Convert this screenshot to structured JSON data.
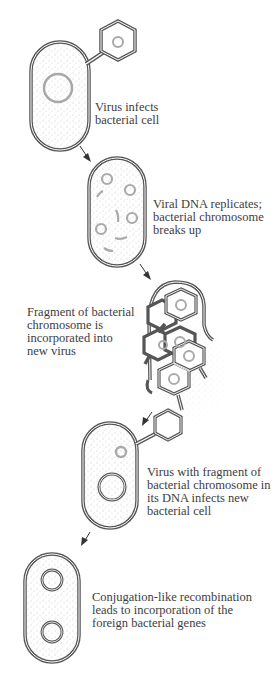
{
  "diagram": {
    "type": "transduction-process",
    "steps": [
      {
        "id": 1,
        "lines": [
          "Virus infects",
          "bacterial cell"
        ]
      },
      {
        "id": 2,
        "lines": [
          "Viral DNA replicates;",
          "bacterial chromosome",
          "breaks up"
        ]
      },
      {
        "id": 3,
        "lines": [
          "Fragment of bacterial",
          "chromosome is",
          "incorporated into",
          "new virus"
        ]
      },
      {
        "id": 4,
        "lines": [
          "Virus with fragment of",
          "bacterial chromosome in",
          "its DNA infects new",
          "bacterial cell"
        ]
      },
      {
        "id": 5,
        "lines": [
          "Conjugation-like recombination",
          "leads to incorporation of the",
          "foreign bacterial genes"
        ]
      }
    ],
    "colors": {
      "outline": "#555555",
      "dna": "#a0a0a0",
      "stipple": "#9a9a9a",
      "text": "#3d3d3d"
    }
  }
}
